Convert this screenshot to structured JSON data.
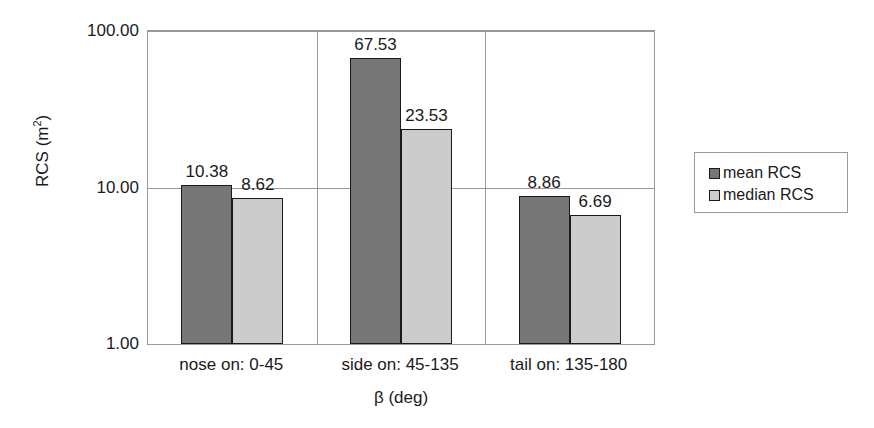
{
  "chart_data": {
    "type": "bar",
    "title": "",
    "xlabel": "β (deg)",
    "ylabel": "RCS (m",
    "ylabel_sup": "2",
    "ylabel_suffix": ")",
    "yscale": "log",
    "ylim": [
      1.0,
      100.0
    ],
    "yticks": [
      "1.00",
      "10.00",
      "100.00"
    ],
    "ytick_values": [
      1.0,
      10.0,
      100.0
    ],
    "grid": true,
    "legend_position": "right",
    "categories": [
      "nose on:  0-45",
      "side on: 45-135",
      "tail on: 135-180"
    ],
    "series": [
      {
        "name": "mean RCS",
        "color": "#767676",
        "values": [
          10.38,
          67.53,
          8.86
        ],
        "labels": [
          "10.38",
          "67.53",
          "8.86"
        ]
      },
      {
        "name": "median RCS",
        "color": "#cccccc",
        "values": [
          8.62,
          23.53,
          6.69
        ],
        "labels": [
          "8.62",
          "23.53",
          "6.69"
        ]
      }
    ]
  },
  "legend": {
    "items": [
      {
        "label": "mean RCS",
        "color": "#767676"
      },
      {
        "label": "median RCS",
        "color": "#cccccc"
      }
    ]
  },
  "colors": {
    "mean": "#767676",
    "median": "#cccccc",
    "axis": "#9a9a9a",
    "outline": "#1a1a1a",
    "background": "#ffffff"
  }
}
